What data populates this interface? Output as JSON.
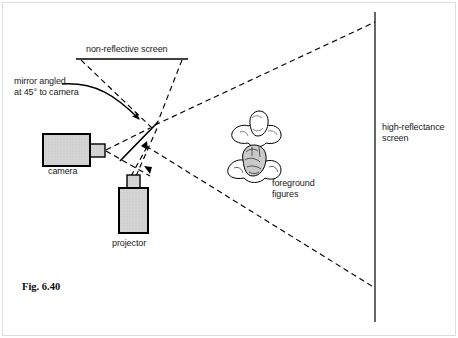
{
  "figure": {
    "caption": "Fig. 6.40",
    "border_color": "#d8d8d8",
    "ink_color": "#000000",
    "fill_color": "#d0d0d0"
  },
  "labels": {
    "non_reflective_screen": "non-reflective screen",
    "mirror": "mirror angled\nat 45° to camera",
    "camera": "camera",
    "projector": "projector",
    "foreground_figures": "foreground\nfigures",
    "high_reflectance_screen": "high-reflectance\nscreen"
  },
  "elements": {
    "camera_body": {
      "x": 43,
      "y": 135,
      "w": 47,
      "h": 31
    },
    "camera_lens": {
      "x": 90,
      "y": 144,
      "w": 15,
      "h": 12
    },
    "projector_body": {
      "x": 119,
      "y": 188,
      "w": 28,
      "h": 45
    },
    "projector_lens": {
      "x": 127,
      "y": 176,
      "w": 12,
      "h": 13
    },
    "mirror_line": {
      "x1": 157,
      "y1": 123,
      "x2": 122,
      "y2": 159
    },
    "non_reflective_screen_line": {
      "x1": 76,
      "y1": 59,
      "x2": 188,
      "y2": 59
    },
    "high_reflectance_screen_line": {
      "x1": 375,
      "y1": 12,
      "x2": 375,
      "y2": 322
    },
    "convergence_point": {
      "x": 155,
      "y": 125
    },
    "beam_upper": {
      "x1": 155,
      "y1": 125,
      "x2": 375,
      "y2": 22
    },
    "beam_lower": {
      "x1": 146,
      "y1": 146,
      "x2": 375,
      "y2": 288
    },
    "figure_head_upper": {
      "cx": 255,
      "cy": 133
    },
    "figure_head_lower": {
      "cx": 253,
      "cy": 168
    }
  }
}
